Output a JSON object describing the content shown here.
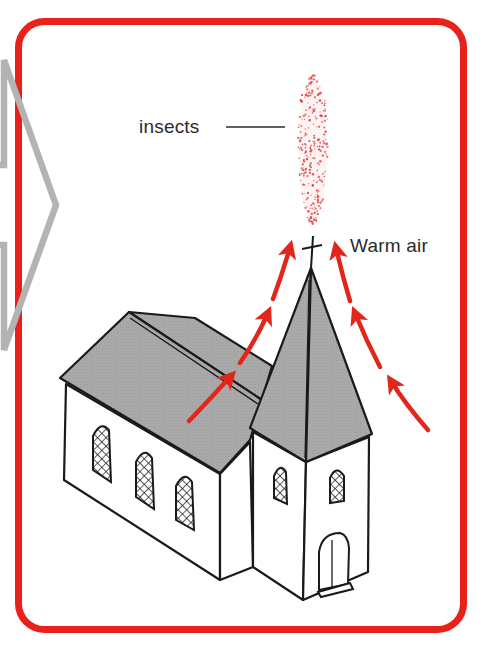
{
  "diagram": {
    "type": "illustration",
    "labels": {
      "insects": "insects",
      "warm_air": "Warm air"
    },
    "colors": {
      "frame": "#e8211a",
      "arrows": "#e1261c",
      "insect_dots": "#d9403a",
      "roof": "#a9a9a9",
      "walls": "#ffffff",
      "outline": "#1a1a1a",
      "chevron": "#b3b3b3",
      "text": "#2b2b2b"
    },
    "elements": {
      "frame": "rounded red border panel",
      "chevron": "gray outlined right-pointing arrow (connector from previous panel)",
      "insect_cloud": "elongated vertical cloud of red dots above the spire",
      "cross": "cross on top of spire",
      "arrows_left": 3,
      "arrows_right": 3,
      "nave_windows": 3,
      "tower_windows": 2,
      "tower_door": 1
    }
  }
}
